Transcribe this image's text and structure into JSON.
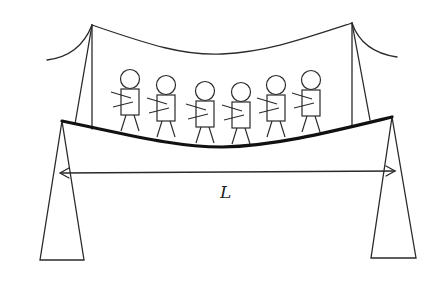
{
  "diagram": {
    "span_label": "L",
    "people_count": 6,
    "stroke_color": "#2a2a2a",
    "deck_color": "#111111",
    "people": [
      {
        "id": 1,
        "head_x": 130,
        "head_y": 79
      },
      {
        "id": 2,
        "head_x": 166,
        "head_y": 85
      },
      {
        "id": 3,
        "head_x": 205,
        "head_y": 91
      },
      {
        "id": 4,
        "head_x": 241,
        "head_y": 92
      },
      {
        "id": 5,
        "head_x": 276,
        "head_y": 85
      },
      {
        "id": 6,
        "head_x": 311,
        "head_y": 80
      }
    ]
  }
}
